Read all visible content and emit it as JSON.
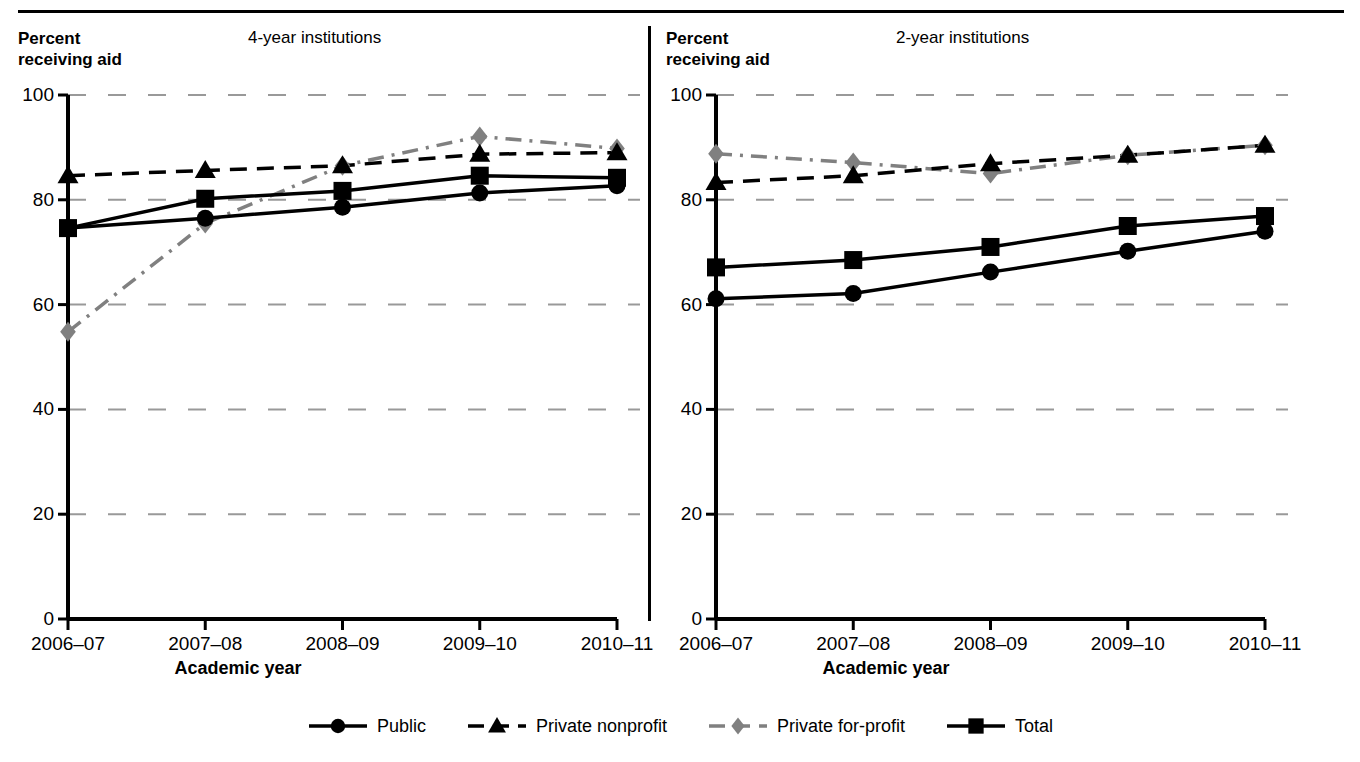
{
  "figure": {
    "top_rule": true,
    "divider": true
  },
  "panels": [
    {
      "id": "four-year",
      "title": "4-year institutions",
      "y_axis_caption": "Percent\nreceiving aid",
      "x_axis_title": "Academic year"
    },
    {
      "id": "two-year",
      "title": "2-year institutions",
      "y_axis_caption": "Percent\nreceiving aid",
      "x_axis_title": "Academic year"
    }
  ],
  "legend": {
    "items": [
      {
        "label": "Public",
        "style": "solid",
        "marker": "circle",
        "color": "#000000"
      },
      {
        "label": "Private nonprofit",
        "style": "dashed",
        "marker": "triangle",
        "color": "#000000"
      },
      {
        "label": "Private for-profit",
        "style": "dashdot",
        "marker": "diamond",
        "color": "#808080"
      },
      {
        "label": "Total",
        "style": "solid",
        "marker": "square",
        "color": "#000000"
      }
    ]
  },
  "chart_data": [
    {
      "type": "line",
      "title": "4-year institutions",
      "xlabel": "Academic year",
      "ylabel": "Percent receiving aid",
      "categories": [
        "2006–07",
        "2007–08",
        "2008–09",
        "2009–10",
        "2010–11"
      ],
      "ylim": [
        0,
        100
      ],
      "yticks": [
        0,
        20,
        40,
        60,
        80,
        100
      ],
      "grid": "horizontal-dashed",
      "legend_position": "bottom",
      "series": [
        {
          "name": "Public",
          "marker": "circle",
          "style": "solid",
          "color": "#000000",
          "values": [
            74.6,
            76.5,
            78.6,
            81.3,
            82.7
          ]
        },
        {
          "name": "Private nonprofit",
          "marker": "triangle",
          "style": "dashed",
          "color": "#000000",
          "values": [
            84.6,
            85.6,
            86.5,
            88.7,
            89.0
          ]
        },
        {
          "name": "Private for-profit",
          "marker": "diamond",
          "style": "dashdot",
          "color": "#808080",
          "values": [
            54.8,
            75.5,
            86.5,
            92.1,
            89.8
          ]
        },
        {
          "name": "Total",
          "marker": "square",
          "style": "solid",
          "color": "#000000",
          "values": [
            74.6,
            80.2,
            81.7,
            84.6,
            84.2
          ]
        }
      ]
    },
    {
      "type": "line",
      "title": "2-year institutions",
      "xlabel": "Academic year",
      "ylabel": "Percent receiving aid",
      "categories": [
        "2006–07",
        "2007–08",
        "2008–09",
        "2009–10",
        "2010–11"
      ],
      "ylim": [
        0,
        100
      ],
      "yticks": [
        0,
        20,
        40,
        60,
        80,
        100
      ],
      "grid": "horizontal-dashed",
      "legend_position": "bottom",
      "series": [
        {
          "name": "Public",
          "marker": "circle",
          "style": "solid",
          "color": "#000000",
          "values": [
            61.1,
            62.1,
            66.2,
            70.2,
            74.0
          ]
        },
        {
          "name": "Private nonprofit",
          "marker": "triangle",
          "style": "dashed",
          "color": "#000000",
          "values": [
            83.3,
            84.6,
            86.9,
            88.5,
            90.4
          ]
        },
        {
          "name": "Private for-profit",
          "marker": "diamond",
          "style": "dashdot",
          "color": "#808080",
          "values": [
            88.8,
            87.1,
            85.0,
            88.5,
            90.4
          ]
        },
        {
          "name": "Total",
          "marker": "square",
          "style": "solid",
          "color": "#000000",
          "values": [
            67.1,
            68.5,
            71.0,
            75.0,
            76.9
          ]
        }
      ]
    }
  ]
}
